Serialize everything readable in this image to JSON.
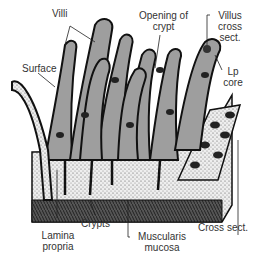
{
  "diagram": {
    "colors": {
      "villus_fill": "#9e9e9e",
      "outline": "#111111",
      "stipple_bg": "#e8e8e8",
      "muscle": "#333333"
    },
    "labels": {
      "villi": "Villi",
      "opening_of_crypt_1": "Opening of",
      "opening_of_crypt_2": "crypt",
      "villus_cross_sect_1": "Villus",
      "villus_cross_sect_2": "cross",
      "villus_cross_sect_3": "sect.",
      "surface": "Surface",
      "lp_core_1": "Lp",
      "lp_core_2": "core",
      "crypts": "Crypts",
      "lamina_propria_1": "Lamina",
      "lamina_propria_2": "propria",
      "muscularis_mucosa_1": "Muscularis",
      "muscularis_mucosa_2": "mucosa",
      "cross_sect": "Cross sect."
    }
  }
}
